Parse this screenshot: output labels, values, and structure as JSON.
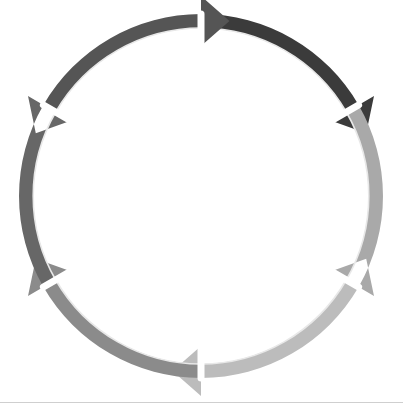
{
  "diagram": {
    "type": "cycle",
    "title": "",
    "direction": "clockwise",
    "center": {
      "x": 201,
      "y": 196
    },
    "outer_radius": 182,
    "segments": [
      {
        "id": "abuse",
        "label": "Abuse",
        "lines": [
          "Abuse"
        ],
        "order": 1,
        "color": "#3b3b3b",
        "start_angle_deg": -90,
        "end_angle_deg": -30,
        "label_x": 262,
        "label_y": 110,
        "arrow_name": "cycle-arrow-abuse"
      },
      {
        "id": "make-excuses",
        "label": "Make excuses",
        "lines": [
          "Make",
          "excuses"
        ],
        "order": 2,
        "color": "#a9a9a9",
        "start_angle_deg": -30,
        "end_angle_deg": 30,
        "label_x": 305,
        "label_y": 205,
        "arrow_name": "cycle-arrow-make-excuses"
      },
      {
        "id": "everything-is-great",
        "label": "Everything is great",
        "lines": [
          "Everything",
          "is great"
        ],
        "order": 3,
        "color": "#bcbcbc",
        "start_angle_deg": 30,
        "end_angle_deg": 90,
        "label_x": 255,
        "label_y": 303,
        "arrow_name": "cycle-arrow-everything-is-great"
      },
      {
        "id": "day-to-day",
        "label": "Day-to-day",
        "lines": [
          "Day-to-day"
        ],
        "order": 4,
        "color": "#8b8b8b",
        "start_angle_deg": 90,
        "end_angle_deg": 150,
        "label_x": 144,
        "label_y": 300,
        "arrow_name": "cycle-arrow-day-to-day"
      },
      {
        "id": "tension-builds",
        "label": "Tension builds",
        "lines": [
          "Tension",
          "builds"
        ],
        "order": 5,
        "color": "#676767",
        "start_angle_deg": 150,
        "end_angle_deg": 210,
        "label_x": 95,
        "label_y": 203,
        "arrow_name": "cycle-arrow-tension-builds"
      },
      {
        "id": "event-sets-off",
        "label": "Event sets off",
        "lines": [
          "Event sets",
          "off"
        ],
        "order": 6,
        "color": "#555555",
        "start_angle_deg": 210,
        "end_angle_deg": 270,
        "label_x": 144,
        "label_y": 107,
        "arrow_name": "cycle-arrow-event-sets-off"
      }
    ]
  },
  "colors": {
    "background": "#ffffff",
    "label_text": "#ffffff",
    "divider": "#ffffff",
    "inner_arc": "#e8e8e8",
    "bottom_rule": "#cfcfcf"
  }
}
